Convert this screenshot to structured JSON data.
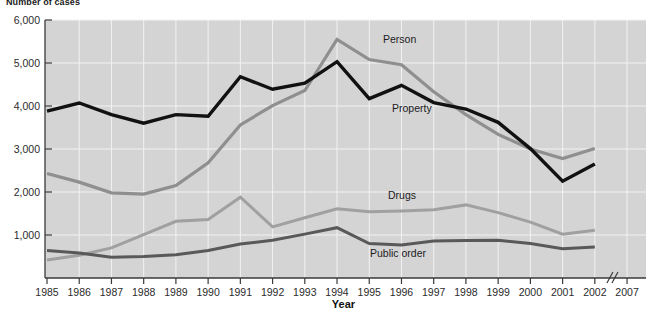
{
  "chart_data": {
    "type": "line",
    "title": "Number of cases",
    "xlabel": "Year",
    "ylabel": "",
    "categories": [
      "1985",
      "1986",
      "1987",
      "1988",
      "1989",
      "1990",
      "1991",
      "1992",
      "1993",
      "1994",
      "1995",
      "1996",
      "1997",
      "1998",
      "1999",
      "2000",
      "2001",
      "2002"
    ],
    "x_tick_labels": [
      "1985",
      "1986",
      "1987",
      "1988",
      "1989",
      "1990",
      "1991",
      "1992",
      "1993",
      "1994",
      "1995",
      "1996",
      "1997",
      "1998",
      "1999",
      "2000",
      "2001",
      "2002",
      "2007"
    ],
    "y_tick_labels": [
      "1,000",
      "2,000",
      "3,000",
      "4,000",
      "5,000",
      "6,000"
    ],
    "y_ticks": [
      1000,
      2000,
      3000,
      4000,
      5000,
      6000
    ],
    "ylim": [
      0,
      6000
    ],
    "grid": true,
    "legend_position": "inline-labels",
    "axis_break": "//",
    "axis_break_note": "x-axis break between 2002 and 2007",
    "series": [
      {
        "name": "Person",
        "color": "#8f8f8f",
        "values": [
          2430,
          2230,
          1980,
          1950,
          2150,
          2680,
          3560,
          4010,
          4360,
          5550,
          5080,
          4960,
          4330,
          3800,
          3340,
          3000,
          2780,
          3010
        ]
      },
      {
        "name": "Property",
        "color": "#111111",
        "values": [
          3880,
          4070,
          3800,
          3600,
          3800,
          3760,
          4680,
          4390,
          4530,
          5030,
          4170,
          4480,
          4080,
          3930,
          3620,
          3010,
          2250,
          2650
        ]
      },
      {
        "name": "Drugs",
        "color": "#a0a0a0",
        "values": [
          420,
          530,
          700,
          1010,
          1320,
          1360,
          1880,
          1190,
          1400,
          1610,
          1540,
          1560,
          1590,
          1700,
          1520,
          1300,
          1020,
          1110
        ]
      },
      {
        "name": "Public order",
        "color": "#595959",
        "values": [
          640,
          580,
          480,
          500,
          540,
          640,
          790,
          880,
          1020,
          1170,
          800,
          770,
          860,
          870,
          880,
          800,
          680,
          720
        ]
      }
    ],
    "series_label_positions": [
      {
        "name": "Person",
        "x": 383,
        "y": 43
      },
      {
        "name": "Property",
        "x": 392,
        "y": 112
      },
      {
        "name": "Drugs",
        "x": 388,
        "y": 199
      },
      {
        "name": "Public order",
        "x": 370,
        "y": 257
      }
    ]
  }
}
